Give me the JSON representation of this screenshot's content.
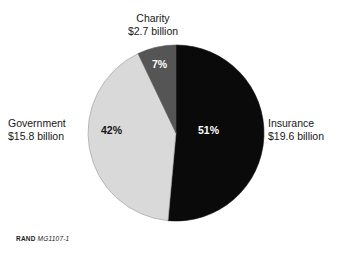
{
  "figure": {
    "background_color": "#ffffff",
    "caption_brand": "RAND",
    "caption_document_id": "MG1107-1"
  },
  "labels": {
    "charity": {
      "name": "Charity",
      "amount": "$2.7 billion",
      "percent": "7%"
    },
    "government": {
      "name": "Government",
      "amount": "$15.8 billion",
      "percent": "42%"
    },
    "insurance": {
      "name": "Insurance",
      "amount": "$19.6 billion",
      "percent": "51%"
    }
  },
  "chart_data": {
    "type": "pie",
    "title": "",
    "subtitle": "",
    "xlabel": "",
    "ylabel": "",
    "legend_position": "callout-labels",
    "grid": false,
    "start_angle_deg": 0,
    "direction": "clockwise",
    "center": {
      "x": 176,
      "y": 133
    },
    "radius": 88,
    "total_label": "",
    "categories": [
      "Insurance",
      "Government",
      "Charity"
    ],
    "values": [
      19.6,
      15.8,
      2.7
    ],
    "value_unit": "billion USD",
    "percentages": [
      51,
      42,
      7
    ],
    "colors": [
      "#0a0a0a",
      "#d9d9d9",
      "#555555"
    ],
    "slices": [
      {
        "label": "Insurance",
        "value": 19.6,
        "value_label": "$19.6 billion",
        "percent": 51,
        "percent_label": "51%",
        "color": "#0a0a0a",
        "label_color": "#ffffff"
      },
      {
        "label": "Government",
        "value": 15.8,
        "value_label": "$15.8 billion",
        "percent": 42,
        "percent_label": "42%",
        "color": "#d9d9d9",
        "label_color": "#151515"
      },
      {
        "label": "Charity",
        "value": 2.7,
        "value_label": "$2.7 billion",
        "percent": 7,
        "percent_label": "7%",
        "color": "#555555",
        "label_color": "#ffffff"
      }
    ]
  }
}
